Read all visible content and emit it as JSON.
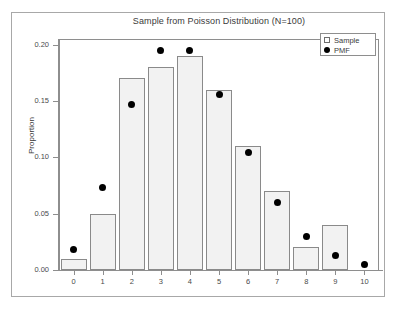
{
  "chart_data": {
    "type": "bar",
    "title": "Sample from Poisson Distribution (N=100)",
    "xlabel": "",
    "ylabel": "Proportion",
    "categories": [
      "0",
      "1",
      "2",
      "3",
      "4",
      "5",
      "6",
      "7",
      "8",
      "9",
      "10"
    ],
    "ylim": [
      0.0,
      0.205
    ],
    "yticks": [
      0.0,
      0.05,
      0.1,
      0.15,
      0.2
    ],
    "ytick_labels": [
      "0.00",
      "0.05",
      "0.10",
      "0.15",
      "0.20"
    ],
    "grid": false,
    "legend_position": "top-right",
    "series": [
      {
        "name": "Sample",
        "marker": "open-square",
        "render": "bar",
        "values": [
          0.01,
          0.05,
          0.17,
          0.18,
          0.19,
          0.16,
          0.11,
          0.07,
          0.02,
          0.04,
          0.0
        ]
      },
      {
        "name": "PMF",
        "marker": "filled-circle",
        "render": "point",
        "values": [
          0.018,
          0.073,
          0.147,
          0.195,
          0.195,
          0.156,
          0.104,
          0.06,
          0.03,
          0.013,
          0.005
        ]
      }
    ],
    "colors": {
      "bar_fill": "#f2f2f2",
      "bar_edge": "#8a8a8a",
      "point": "#000000",
      "axis": "#8e8e8e",
      "text": "#3a3a3a",
      "background": "#ffffff"
    }
  },
  "legend": {
    "entries": [
      {
        "label": "Sample",
        "icon": "open-square-icon"
      },
      {
        "label": "PMF",
        "icon": "filled-circle-icon"
      }
    ]
  }
}
